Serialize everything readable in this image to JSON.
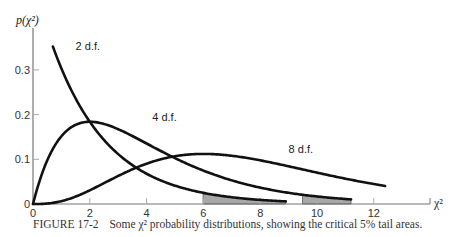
{
  "chart_data": {
    "type": "line",
    "title": "",
    "xlabel": "χ²",
    "ylabel": "p(χ²)",
    "xlim": [
      0,
      13.8
    ],
    "ylim": [
      0,
      0.37
    ],
    "xticks": [
      0,
      2,
      4,
      6,
      8,
      10,
      12
    ],
    "yticks": [
      0,
      0.1,
      0.2,
      0.3
    ],
    "xtick_labels": [
      "0",
      "2",
      "4",
      "6",
      "8",
      "10",
      "12"
    ],
    "ytick_labels": [
      "0",
      "0.1",
      "0.2",
      "0.3"
    ],
    "grid": false,
    "legend": null,
    "series": [
      {
        "name": "2 d.f.",
        "df": 2,
        "x_range": [
          0.7,
          8.9
        ],
        "critical_value": 5.99,
        "shaded_tail": [
          5.99,
          8.9
        ]
      },
      {
        "name": "4 d.f.",
        "df": 4,
        "x_range": [
          0,
          11.2
        ],
        "critical_value": 9.49,
        "shaded_tail": [
          9.49,
          11.2
        ]
      },
      {
        "name": "8 d.f.",
        "df": 8,
        "x_range": [
          0,
          12.4
        ],
        "critical_value": 15.51,
        "shaded_tail": null
      }
    ],
    "annotations": [
      {
        "text": "2 d.f.",
        "x": 1.5,
        "y": 0.345
      },
      {
        "text": "4 d.f.",
        "x": 4.2,
        "y": 0.185
      },
      {
        "text": "8 d.f.",
        "x": 9.0,
        "y": 0.113
      }
    ],
    "caption": "FIGURE 17-2  Some χ² probability distributions, showing the critical 5% tail areas."
  },
  "caption": {
    "figure_number": "FIGURE 17-2",
    "text": "Some χ² probability distributions, showing the critical 5% tail areas."
  },
  "axes": {
    "x_label": "χ²",
    "y_label": "p(χ²)"
  }
}
